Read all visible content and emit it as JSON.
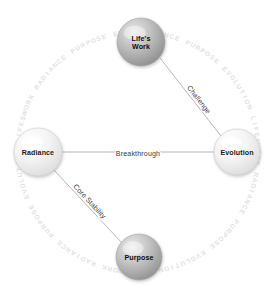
{
  "diagram": {
    "background_color": "#ffffff",
    "canvas": {
      "width": 276,
      "height": 291
    },
    "ring": {
      "center_x": 138,
      "center_y": 152,
      "radius": 118,
      "glyph_color": "#e2e2e4",
      "repeat_text": "RADIANCE PURPOSE EVOLUTION LIFESWORK ",
      "description": "faint decorative ring of small repeated glyphs circling the diagram"
    },
    "nodes": [
      {
        "id": "lifes-work",
        "label_line1": "Life's",
        "label_line2": "Work",
        "label": "Life's Work",
        "cx": 141,
        "cy": 42,
        "r": 24,
        "style": "dark",
        "fill_light": "#e9e9e9",
        "fill_mid": "#bdbdbd",
        "fill_dark": "#8e8e8e",
        "stroke": "#a6a6a6"
      },
      {
        "id": "evolution",
        "label_line1": "Evolution",
        "label_line2": "",
        "label": "Evolution",
        "cx": 237,
        "cy": 152,
        "r": 23,
        "style": "light",
        "fill_light": "#ffffff",
        "fill_mid": "#f4f4f4",
        "fill_dark": "#dcdcdc",
        "stroke": "#cfcfcf"
      },
      {
        "id": "radiance",
        "label_line1": "Radiance",
        "label_line2": "",
        "label": "Radiance",
        "cx": 38,
        "cy": 152,
        "r": 24,
        "style": "light",
        "fill_light": "#ffffff",
        "fill_mid": "#f4f4f4",
        "fill_dark": "#dcdcdc",
        "stroke": "#cfcfcf"
      },
      {
        "id": "purpose",
        "label_line1": "Purpose",
        "label_line2": "",
        "label": "Purpose",
        "cx": 139,
        "cy": 257,
        "r": 23,
        "style": "dark",
        "fill_light": "#ececec",
        "fill_mid": "#c2c2c2",
        "fill_dark": "#909090",
        "stroke": "#a6a6a6"
      }
    ],
    "edges": [
      {
        "id": "challenge",
        "label": "Challenge",
        "from": "lifes-work",
        "to": "evolution",
        "x1": 160,
        "y1": 58,
        "x2": 221,
        "y2": 136,
        "label_x": 197,
        "label_y": 101,
        "label_rotation": 52,
        "stroke": "#9a9a9a"
      },
      {
        "id": "breakthrough",
        "label": "Breakthrough",
        "from": "radiance",
        "to": "evolution",
        "x1": 62,
        "y1": 152,
        "x2": 214,
        "y2": 152,
        "label_x": 138,
        "label_y": 156,
        "label_rotation": 0,
        "stroke": "#9a9a9a"
      },
      {
        "id": "core-stability",
        "label": "Core Stability",
        "from": "radiance",
        "to": "purpose",
        "x1": 54,
        "y1": 170,
        "x2": 122,
        "y2": 243,
        "label_x": 88,
        "label_y": 203,
        "label_rotation": 47,
        "stroke": "#9a9a9a"
      }
    ]
  }
}
